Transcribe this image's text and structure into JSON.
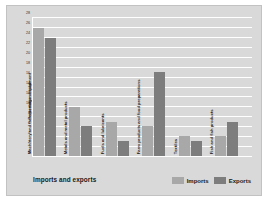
{
  "chart_data": {
    "type": "bar",
    "title": "",
    "xlabel": "Imports and exports",
    "ylabel": "Percentage of total",
    "ylim": [
      0,
      28
    ],
    "yticks": [
      0,
      2,
      4,
      6,
      8,
      10,
      12,
      14,
      16,
      18,
      20,
      22,
      24,
      26,
      28
    ],
    "grid": true,
    "legend_position": "bottom-right",
    "categories": [
      "Machinery and transportation equipment",
      "Metals and metal products",
      "Fuels and lubricants",
      "Farm products and food preparations",
      "Textiles",
      "Fish and fish products"
    ],
    "series": [
      {
        "name": "Imports",
        "color": "#a8a8a8",
        "values": [
          26,
          10,
          7,
          6,
          4,
          4
        ]
      },
      {
        "name": "Exports",
        "color": "#7d7d7d",
        "values": [
          24,
          6,
          3,
          17,
          3,
          7
        ]
      }
    ]
  },
  "legend": {
    "items": [
      {
        "label": "Imports"
      },
      {
        "label": "Exports"
      }
    ]
  },
  "colors": {
    "imports": "#a8a8a8",
    "exports": "#7d7d7d",
    "figure_background": "#d9d9d9",
    "gridline": "#ffffff"
  }
}
